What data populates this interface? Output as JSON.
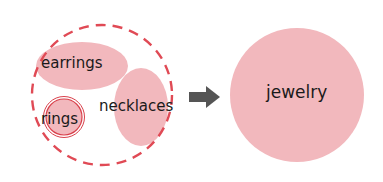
{
  "diagram": {
    "type": "set-aggregation",
    "colors": {
      "fill": "#f2b8bd",
      "dashed_stroke": "#e04a55",
      "ring_stroke": "#d9414c",
      "arrow": "#555555",
      "text": "#1a1a1a"
    },
    "group": {
      "items": [
        {
          "label": "earrings"
        },
        {
          "label": "rings"
        },
        {
          "label": "necklaces"
        }
      ]
    },
    "arrow": {
      "direction": "right"
    },
    "result": {
      "label": "jewelry"
    }
  }
}
